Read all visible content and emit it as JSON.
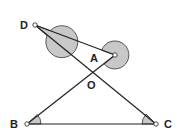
{
  "diagram": {
    "type": "geometry",
    "points": {
      "D": {
        "label": "D",
        "x": 35,
        "y": 25
      },
      "A": {
        "label": "A",
        "x": 115,
        "y": 55
      },
      "O": {
        "label": "O",
        "x": 92,
        "y": 71
      },
      "B": {
        "label": "B",
        "x": 27,
        "y": 124
      },
      "C": {
        "label": "C",
        "x": 156,
        "y": 124
      }
    },
    "segments": [
      [
        "D",
        "A"
      ],
      [
        "D",
        "C"
      ],
      [
        "B",
        "A"
      ],
      [
        "B",
        "C"
      ]
    ],
    "shaded_angles": [
      {
        "vertex": "D",
        "kind": "reflex",
        "between": [
          "A",
          "C"
        ]
      },
      {
        "vertex": "A",
        "kind": "reflex",
        "between": [
          "D",
          "B"
        ]
      },
      {
        "vertex": "B",
        "kind": "interior",
        "between": [
          "A",
          "C"
        ]
      },
      {
        "vertex": "C",
        "kind": "interior",
        "between": [
          "B",
          "D"
        ]
      }
    ],
    "colors": {
      "line": "#222222",
      "shade": "#c8c8c8",
      "point_fill": "#ffffff"
    }
  }
}
